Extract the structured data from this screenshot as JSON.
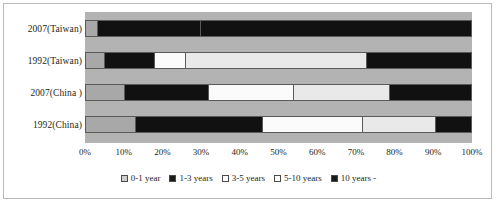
{
  "chart_data": {
    "type": "bar",
    "orientation": "horizontal",
    "stacked": true,
    "percent": true,
    "title": "",
    "xlabel": "",
    "ylabel": "",
    "xlim": [
      0,
      100
    ],
    "grid": false,
    "legend_position": "bottom",
    "categories": [
      "2007(Taiwan)",
      "1992(Taiwan)",
      "2007(China )",
      "1992(China)"
    ],
    "xticks": [
      "0%",
      "10%",
      "20%",
      "30%",
      "40%",
      "50%",
      "60%",
      "70%",
      "80%",
      "90%",
      "100%"
    ],
    "xtick_values": [
      0,
      10,
      20,
      30,
      40,
      50,
      60,
      70,
      80,
      90,
      100
    ],
    "series": [
      {
        "name": "0-1 year",
        "color": "#a8a8a8",
        "values": [
          3,
          5,
          10,
          13
        ]
      },
      {
        "name": "1-3 years",
        "color": "#111111",
        "values": [
          27,
          13,
          22,
          33
        ]
      },
      {
        "name": "3-5 years",
        "color": "#fbfbfb",
        "values": [
          0,
          8,
          22,
          26
        ]
      },
      {
        "name": "5-10 years",
        "color": "#e9e9e9",
        "values": [
          0,
          47,
          25,
          19
        ]
      },
      {
        "name": "10 years -",
        "color": "#111111",
        "values": [
          70,
          27,
          21,
          9
        ]
      }
    ],
    "legend": [
      {
        "label": "0-1 year",
        "color": "#cfcfcf"
      },
      {
        "label": "1-3 years",
        "color": "#1a1a1a"
      },
      {
        "label": "3-5 years",
        "color": "#ffffff"
      },
      {
        "label": "5-10 years",
        "color": "#fdfdfd"
      },
      {
        "label": "10 years -",
        "color": "#1a1a1a"
      }
    ],
    "plot_background": "#b3b3b3",
    "border_color": "#5a5a5a"
  }
}
